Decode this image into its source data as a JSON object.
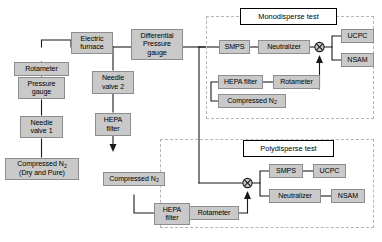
{
  "diagram": {
    "type": "process-flow-schematic",
    "regions": [
      {
        "id": "monodisperse",
        "label": "Monodisperse test"
      },
      {
        "id": "polydisperse",
        "label": "Polydisperse test"
      }
    ],
    "colors": {
      "box_fill": "#c9c9c9",
      "box_border": "#8d8d8d",
      "line": "#1a1a1a",
      "region_border": "#b6b6b6",
      "title_border": "#000000",
      "background": "#ffffff"
    }
  },
  "nodes": {
    "electric_furnace": "Electric\nfurnace",
    "differential_pressure_gauge": "Differential\nPressure\ngauge",
    "rotameter_left": "Rotameter",
    "pressure_gauge": "Pressure\ngauge",
    "needle_valve_1": "Needle\nvalve 1",
    "needle_valve_2": "Needle\nvalve 2",
    "hepa_filter_mid": "HEPA\nfilter",
    "smps_mono": "SMPS",
    "neutralizer_mono": "Neutralizer",
    "ucpc_mono": "UCPC",
    "nsam_mono": "NSAM",
    "hepa_filter_mono": "HEPA filter",
    "rotameter_mono": "Rotameter",
    "smps_poly": "SMPS",
    "ucpc_poly": "UCPC",
    "neutralizer_poly": "Neutralizer",
    "nsam_poly": "NSAM",
    "hepa_filter_poly": "HEPA\nfilter",
    "rotameter_poly": "Rotameter"
  },
  "nodes_rich": {
    "compressed_n2_source_line1": "Compressed N",
    "compressed_n2_source_sub": "2",
    "compressed_n2_source_line2": "(Dry and Pure)",
    "compressed_n2_mono_text": "Compressed N",
    "compressed_n2_mono_sub": "2",
    "compressed_n2_poly_text": "Compressed N",
    "compressed_n2_poly_sub": "2"
  },
  "symbols": {
    "mixer_mono": "mixer-junction",
    "mixer_poly": "mixer-junction",
    "exhaust_arrow": "downward-arrow"
  }
}
